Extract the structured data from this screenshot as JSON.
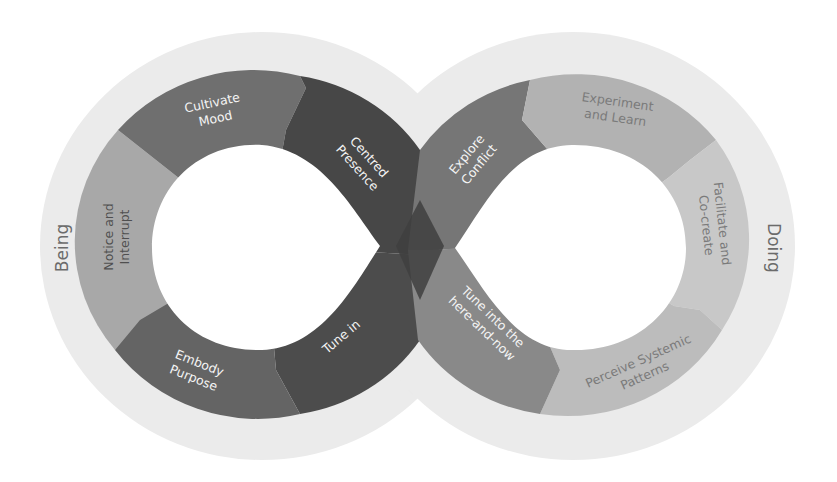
{
  "diagram": {
    "type": "infinity-loop",
    "side_labels": {
      "left": "Being",
      "right": "Doing"
    },
    "left_loop": {
      "segments": [
        {
          "label_line1": "Cultivate",
          "label_line2": "Mood",
          "color": "#6e6e6e"
        },
        {
          "label_line1": "Centred",
          "label_line2": "Presence",
          "color": "#4a4a4a"
        },
        {
          "label_line1": "Tune in",
          "label_line2": "",
          "color": "#4e4e4e"
        },
        {
          "label_line1": "Embody",
          "label_line2": "Purpose",
          "color": "#666666"
        },
        {
          "label_line1": "Notice and",
          "label_line2": "Interrupt",
          "color": "#a6a6a6"
        }
      ]
    },
    "right_loop": {
      "segments": [
        {
          "label_line1": "Explore",
          "label_line2": "Conflict",
          "color": "#777777"
        },
        {
          "label_line1": "Experiment",
          "label_line2": "and Learn",
          "color": "#b3b3b3"
        },
        {
          "label_line1": "Facilitate and",
          "label_line2": "Co-create",
          "color": "#c7c7c7"
        },
        {
          "label_line1": "Perceive Systemic",
          "label_line2": "Patterns",
          "color": "#bdbdbd"
        },
        {
          "label_line1": "Tune into the",
          "label_line2": "here-and-now",
          "color": "#8a8a8a"
        }
      ]
    },
    "colors": {
      "halo": "#e9e9e9",
      "background": "#ffffff",
      "hole": "#ffffff",
      "side_label": "#6b6b6b"
    }
  }
}
